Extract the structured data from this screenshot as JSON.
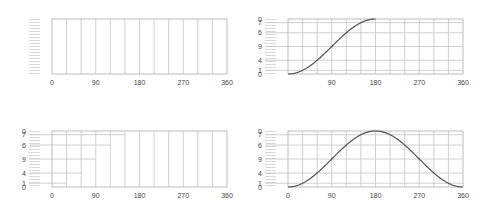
{
  "colors": {
    "frame": "#b5b5b5",
    "grid": "#c4c4c4",
    "tick": "#c8c8c8",
    "curve": "#505050",
    "label": "#444444"
  },
  "chart_data": [
    {
      "id": "top-left",
      "type": "line",
      "title": "",
      "xlabel": "",
      "ylabel": "",
      "x_ticks": [
        "0",
        "90",
        "180",
        "270",
        "360"
      ],
      "x_range": [
        0,
        360
      ],
      "x_grid_step": 30,
      "y_tick_labels": [],
      "y_range": [
        0,
        1
      ],
      "h_levels": [],
      "h_extent_deg": [],
      "series": [],
      "grid": true,
      "legend": "none",
      "box": {
        "x": 52,
        "y": 19,
        "w": 175,
        "h": 55
      }
    },
    {
      "id": "top-right",
      "type": "line",
      "title": "",
      "xlabel": "",
      "ylabel": "",
      "x_ticks": [
        "",
        "90",
        "180",
        "270",
        "360"
      ],
      "x_range": [
        0,
        360
      ],
      "x_grid_step": 30,
      "y_tick_labels": [
        "0",
        "7",
        "6",
        "9",
        "4",
        "1",
        "0"
      ],
      "y_range": [
        0,
        1
      ],
      "h_levels": [
        0.067,
        0.25,
        0.5,
        0.75,
        0.933
      ],
      "h_extent_deg": [
        360,
        360,
        360,
        360,
        360
      ],
      "series": [
        {
          "name": "ease (1-cos x)/2, 0–180°",
          "x": [
            0,
            15,
            30,
            45,
            60,
            75,
            90,
            105,
            120,
            135,
            150,
            165,
            180
          ],
          "y": [
            0,
            0.017,
            0.067,
            0.146,
            0.25,
            0.371,
            0.5,
            0.629,
            0.75,
            0.854,
            0.933,
            0.983,
            1.0
          ]
        }
      ],
      "grid": true,
      "legend": "none",
      "box": {
        "x": 288,
        "y": 19,
        "w": 175,
        "h": 55
      }
    },
    {
      "id": "bottom-left",
      "type": "line",
      "title": "",
      "xlabel": "",
      "ylabel": "",
      "x_ticks": [
        "0",
        "90",
        "180",
        "270",
        "360"
      ],
      "x_range": [
        0,
        360
      ],
      "x_grid_step": 30,
      "y_tick_labels": [
        "0",
        "7",
        "6",
        "9",
        "4",
        "1",
        "0"
      ],
      "y_range": [
        0,
        1
      ],
      "h_levels": [
        0.067,
        0.25,
        0.5,
        0.75,
        0.933
      ],
      "h_extent_deg": [
        30,
        60,
        90,
        120,
        150
      ],
      "series": [],
      "grid": true,
      "legend": "none",
      "box": {
        "x": 52,
        "y": 131,
        "w": 175,
        "h": 56
      }
    },
    {
      "id": "bottom-right",
      "type": "line",
      "title": "",
      "xlabel": "",
      "ylabel": "",
      "x_ticks": [
        "0",
        "90",
        "180",
        "270",
        "360"
      ],
      "x_range": [
        0,
        360
      ],
      "x_grid_step": 30,
      "y_tick_labels": [
        "0",
        "7",
        "6",
        "9",
        "4",
        "1",
        "0"
      ],
      "y_range": [
        0,
        1
      ],
      "h_levels": [
        0.067,
        0.25,
        0.5,
        0.75,
        0.933
      ],
      "h_extent_deg": [
        360,
        360,
        360,
        360,
        360
      ],
      "series": [
        {
          "name": "(1-cos x)/2, 0–360°",
          "x": [
            0,
            30,
            60,
            90,
            120,
            150,
            180,
            210,
            240,
            270,
            300,
            330,
            360
          ],
          "y": [
            0,
            0.067,
            0.25,
            0.5,
            0.75,
            0.933,
            1.0,
            0.933,
            0.75,
            0.5,
            0.25,
            0.067,
            0
          ]
        }
      ],
      "grid": true,
      "legend": "none",
      "box": {
        "x": 288,
        "y": 131,
        "w": 175,
        "h": 56
      }
    }
  ]
}
